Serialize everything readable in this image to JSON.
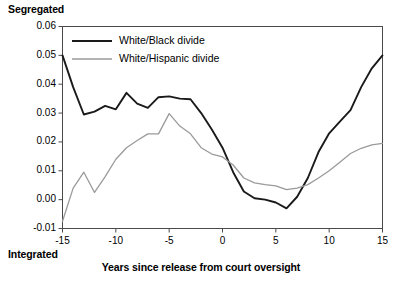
{
  "labels": {
    "top_axis_title": "Segregated",
    "bottom_axis_title": "Integrated",
    "x_axis_title": "Years since release from court oversight"
  },
  "axis": {
    "y_ticks": [
      "0.06",
      "0.05",
      "0.04",
      "0.03",
      "0.02",
      "0.01",
      "0.00",
      "-0.01"
    ],
    "x_ticks": [
      "-15",
      "-10",
      "-5",
      "0",
      "5",
      "10",
      "15"
    ]
  },
  "legend": {
    "items": [
      {
        "label": "White/Black divide",
        "color": "#1a1a1a"
      },
      {
        "label": "White/Hispanic divide",
        "color": "#9a9a9a"
      }
    ]
  },
  "chart_data": {
    "type": "line",
    "title": "",
    "subtitle": "",
    "xlabel": "Years since release from court oversight",
    "ylabel": "Segregated / Integrated",
    "xlim": [
      -15,
      15
    ],
    "ylim": [
      -0.01,
      0.06
    ],
    "grid": false,
    "legend_position": "top-left-inside",
    "annotations": [
      {
        "text": "Segregated",
        "position": "above-y-axis-top"
      },
      {
        "text": "Integrated",
        "position": "below-y-axis-bottom"
      }
    ],
    "x": [
      -15,
      -14,
      -13,
      -12,
      -11,
      -10,
      -9,
      -8,
      -7,
      -6,
      -5,
      -4,
      -3,
      -2,
      -1,
      0,
      1,
      2,
      3,
      4,
      5,
      6,
      7,
      8,
      9,
      10,
      11,
      12,
      13,
      14,
      15
    ],
    "series": [
      {
        "name": "White/Black divide",
        "color": "#1a1a1a",
        "values": [
          0.05,
          0.039,
          0.0295,
          0.0305,
          0.0325,
          0.0313,
          0.037,
          0.0333,
          0.0318,
          0.0355,
          0.0358,
          0.035,
          0.0348,
          0.03,
          0.0243,
          0.018,
          0.0095,
          0.0028,
          0.0005,
          0.0,
          -0.001,
          -0.003,
          0.001,
          0.0075,
          0.0165,
          0.023,
          0.027,
          0.031,
          0.039,
          0.0455,
          0.05
        ]
      },
      {
        "name": "White/Hispanic divide",
        "color": "#9a9a9a",
        "values": [
          -0.0075,
          0.004,
          0.0095,
          0.0025,
          0.008,
          0.014,
          0.018,
          0.0205,
          0.0228,
          0.0228,
          0.0298,
          0.0255,
          0.0228,
          0.018,
          0.0158,
          0.0148,
          0.012,
          0.0075,
          0.0058,
          0.0052,
          0.0048,
          0.0035,
          0.004,
          0.0052,
          0.0075,
          0.01,
          0.013,
          0.016,
          0.0178,
          0.019,
          0.0195
        ]
      }
    ]
  }
}
